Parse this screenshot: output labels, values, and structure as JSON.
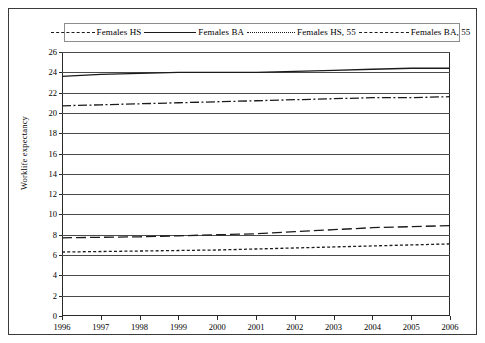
{
  "legend": {
    "position": "top",
    "entries": [
      {
        "label": "Females HS",
        "style": "dash-dot",
        "key": "females_hs"
      },
      {
        "label": "Females BA",
        "style": "solid",
        "key": "females_ba"
      },
      {
        "label": "Females HS,  55",
        "style": "dotted",
        "key": "females_hs_55"
      },
      {
        "label": "Females BA, 55",
        "style": "long-dash",
        "key": "females_ba_55"
      }
    ]
  },
  "axes": {
    "ylabel": "Worklife expectancy",
    "xlabel": "",
    "ylim": [
      0,
      26
    ],
    "ytick_step": 2,
    "yticks": [
      0,
      2,
      4,
      6,
      8,
      10,
      12,
      14,
      16,
      18,
      20,
      22,
      24,
      26
    ],
    "xticks": [
      1996,
      1997,
      1998,
      1999,
      2000,
      2001,
      2002,
      2003,
      2004,
      2005,
      2006
    ],
    "grid": "horizontal"
  },
  "colors": {
    "line": "#1b1b1b",
    "axis": "#2a2a2a",
    "grid": "#4a4a4a",
    "border": "#3a3a3a",
    "background": "#ffffff"
  },
  "chart_data": {
    "type": "line",
    "title": "",
    "xlabel": "",
    "ylabel": "Worklife expectancy",
    "xlim": [
      1996,
      2006
    ],
    "ylim": [
      0,
      26
    ],
    "grid": true,
    "legend_position": "top",
    "x": [
      1996,
      1997,
      1998,
      1999,
      2000,
      2001,
      2002,
      2003,
      2004,
      2005,
      2006
    ],
    "series": [
      {
        "name": "Females HS",
        "style": "dash-dot",
        "values": [
          20.7,
          20.8,
          20.9,
          21.0,
          21.1,
          21.2,
          21.3,
          21.4,
          21.5,
          21.5,
          21.6
        ]
      },
      {
        "name": "Females BA",
        "style": "solid",
        "values": [
          23.6,
          23.8,
          23.9,
          24.0,
          24.0,
          24.0,
          24.1,
          24.2,
          24.3,
          24.4,
          24.4
        ]
      },
      {
        "name": "Females HS,  55",
        "style": "dotted",
        "values": [
          6.3,
          6.35,
          6.4,
          6.45,
          6.5,
          6.6,
          6.7,
          6.8,
          6.9,
          7.0,
          7.1
        ]
      },
      {
        "name": "Females BA, 55",
        "style": "long-dash",
        "values": [
          7.7,
          7.75,
          7.8,
          7.9,
          8.0,
          8.1,
          8.3,
          8.5,
          8.7,
          8.8,
          8.9
        ]
      }
    ]
  }
}
